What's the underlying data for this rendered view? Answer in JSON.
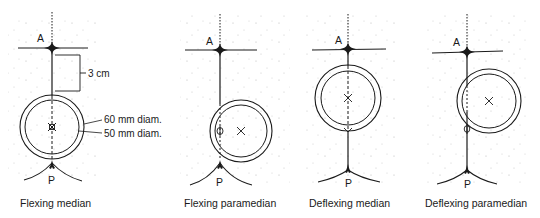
{
  "figure": {
    "type": "anatomical diagram",
    "panels": [
      {
        "caption": "Flexing median",
        "point_top": "A",
        "point_bottom": "P",
        "axis_x": 52,
        "a_y": 48,
        "p_y": 165,
        "circle": {
          "cx": 52,
          "cy": 127,
          "r_outer": 32,
          "r_inner": 27
        },
        "marker_center": "⌘",
        "annotations": {
          "distance": "3 cm",
          "outer_diameter": "60 mm diam.",
          "inner_diameter": "50 mm diam."
        }
      },
      {
        "caption": "Flexing paramedian",
        "point_top": "A",
        "point_bottom": "P",
        "axis_x": 220,
        "a_y": 50,
        "p_y": 163,
        "circle": {
          "cx": 241,
          "cy": 131,
          "r_outer": 31,
          "r_inner": 26
        },
        "marker_center": "×",
        "marker_axis": "Φ"
      },
      {
        "caption": "Deflexing median",
        "point_top": "A",
        "point_bottom": "P",
        "axis_x": 348,
        "a_y": 48,
        "p_y": 173,
        "circle": {
          "cx": 348,
          "cy": 98,
          "r_outer": 33,
          "r_inner": 27
        },
        "marker_center": "×"
      },
      {
        "caption": "Deflexing paramedian",
        "point_top": "A",
        "point_bottom": "P",
        "axis_x": 467,
        "a_y": 51,
        "p_y": 170,
        "circle": {
          "cx": 489,
          "cy": 101,
          "r_outer": 32,
          "r_inner": 27
        },
        "marker_center": "×",
        "marker_axis": "Φ"
      }
    ],
    "colors": {
      "ink": "#1a1a1a",
      "background": "#ffffff",
      "stipple": "#9a9a9a"
    }
  }
}
